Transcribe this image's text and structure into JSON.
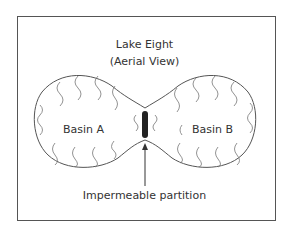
{
  "diagram": {
    "title_line1": "Lake Eight",
    "title_line2": "(Aerial View)",
    "basins": [
      {
        "label": "Basin A"
      },
      {
        "label": "Basin B"
      }
    ],
    "partition_label": "Impermeable partition",
    "colors": {
      "line": "#555555",
      "partition": "#222222",
      "text": "#333333"
    }
  }
}
